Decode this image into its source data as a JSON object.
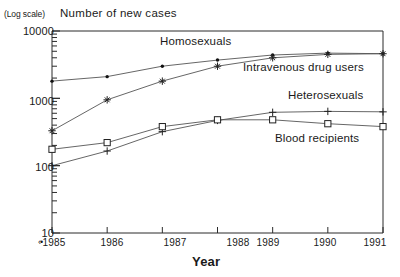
{
  "figure": {
    "log_scale_note": "(Log scale)",
    "y_axis_title": "Number of new cases",
    "x_axis_title": "Year",
    "x_tick_prefix": "‹•"
  },
  "chart_data": {
    "type": "line",
    "title": "Number of new cases",
    "xlabel": "Year",
    "ylabel": "Number of new cases",
    "yscale": "log",
    "ylim": [
      10,
      10000
    ],
    "ytick_labels": [
      "10000",
      "1000",
      "100",
      "10"
    ],
    "yticks": [
      10000,
      1000,
      100,
      10
    ],
    "grid": false,
    "legend_position": "inline-annotations",
    "categories": [
      "1985",
      "1986",
      "1987",
      "1988",
      "1989",
      "1990",
      "1991"
    ],
    "x": [
      1985,
      1986,
      1987,
      1988,
      1989,
      1990,
      1991
    ],
    "series": [
      {
        "name": "Homosexuals",
        "marker": "filled-dot",
        "values": [
          1800,
          2100,
          3000,
          3700,
          4400,
          4700,
          4600
        ]
      },
      {
        "name": "Intravenous drug users",
        "marker": "asterisk",
        "values": [
          330,
          950,
          1800,
          3000,
          4000,
          4500,
          4600
        ]
      },
      {
        "name": "Heterosexuals",
        "marker": "plus",
        "values": [
          100,
          165,
          320,
          470,
          620,
          640,
          630
        ]
      },
      {
        "name": "Blood recipients",
        "marker": "open-square",
        "values": [
          175,
          220,
          380,
          480,
          480,
          420,
          380
        ]
      }
    ]
  },
  "colors": {
    "axis": "#2b2b2b",
    "line": "#555555",
    "text": "#1a1a1a",
    "background": "#ffffff"
  }
}
